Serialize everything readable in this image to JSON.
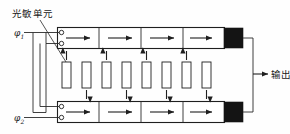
{
  "figure": {
    "type": "ccd-line-sensor-schematic",
    "width": 290,
    "height": 134,
    "background": "#ffffff",
    "ink": "#1f1f1f"
  },
  "labels": {
    "photosensitive_unit": "光敏单元",
    "output": "输出",
    "clock_phase_1": "φ",
    "clock_phase_1_sub": "1",
    "clock_phase_2": "φ",
    "clock_phase_2_sub": "2"
  },
  "top_register": {
    "name": "top-shift-register",
    "cell_count": 4,
    "transfer_direction": "right",
    "arrow_glyph": "→",
    "terminal_count": 2,
    "has_output_amplifier": true,
    "x": 57,
    "y": 27,
    "width": 168,
    "height": 22
  },
  "bottom_register": {
    "name": "bottom-shift-register",
    "cell_count": 4,
    "transfer_direction": "right",
    "arrow_glyph": "→",
    "terminal_count": 2,
    "has_output_amplifier": true,
    "x": 57,
    "y": 101,
    "width": 168,
    "height": 22
  },
  "photosensitive_array": {
    "name": "photosensitive-cell-array",
    "count": 8,
    "cell_width": 9,
    "cell_height": 26,
    "cell_y": 62,
    "start_x": 62,
    "pitch": 20,
    "transfer_arrows": [
      "up",
      "down",
      "up",
      "down",
      "up",
      "down",
      "up",
      "down"
    ],
    "cells": [
      {
        "index": 1,
        "x": 62,
        "direction": "up"
      },
      {
        "index": 2,
        "x": 82,
        "direction": "down"
      },
      {
        "index": 3,
        "x": 102,
        "direction": "up"
      },
      {
        "index": 4,
        "x": 122,
        "direction": "down"
      },
      {
        "index": 5,
        "x": 142,
        "direction": "up"
      },
      {
        "index": 6,
        "x": 162,
        "direction": "down"
      },
      {
        "index": 7,
        "x": 182,
        "direction": "up"
      },
      {
        "index": 8,
        "x": 202,
        "direction": "down"
      }
    ]
  },
  "output_bus": {
    "name": "output-bus",
    "x": 238,
    "arrow_glyph": "→",
    "label": "输出"
  }
}
